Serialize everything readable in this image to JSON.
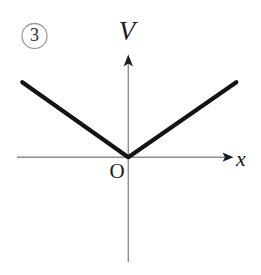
{
  "figure": {
    "badge_label": "3",
    "axis_y_label": "V",
    "axis_x_label": "x",
    "origin_label": "O",
    "colors": {
      "background": "#ffffff",
      "curve": "#141414",
      "axis": "#8e8e8e",
      "arrowhead": "#1b1b1b",
      "badge_ring": "#9a9a9a",
      "text": "#1b1b1b"
    }
  },
  "chart_data": {
    "type": "line",
    "title": "",
    "subtitle": "",
    "xlabel": "x",
    "ylabel": "V",
    "annotations": [
      "3",
      "O"
    ],
    "legend": [],
    "legend_position": "none",
    "grid": false,
    "axis_style": "arrows-from-origin",
    "xlim": [
      -106,
      108
    ],
    "ylim": [
      -105,
      102
    ],
    "origin": {
      "x": 0,
      "y": 0,
      "label": "O"
    },
    "series": [
      {
        "name": "V(x) = k|x|",
        "shape": "v-shaped absolute value",
        "x": [
          -106,
          0,
          108
        ],
        "y": [
          75,
          0,
          75
        ],
        "vertex": {
          "x": 0,
          "y": 0
        },
        "left_branch_slope": -0.708,
        "right_branch_slope": 0.694,
        "linewidth": 4.2,
        "color": "#141414"
      }
    ],
    "axes": {
      "x_axis": {
        "from": -111,
        "to": 105,
        "arrow_at": "end"
      },
      "y_axis": {
        "from": -105,
        "to": 102,
        "arrow_at": "end"
      }
    }
  }
}
